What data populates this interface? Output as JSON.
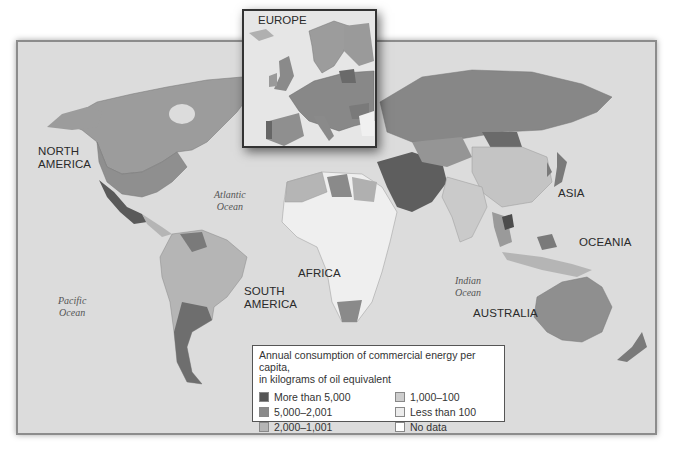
{
  "map": {
    "title": "Annual consumption of commercial energy per capita",
    "inset": {
      "title": "EUROPE"
    },
    "continent_labels": [
      {
        "id": "north-america",
        "lines": [
          "NORTH",
          "AMERICA"
        ]
      },
      {
        "id": "south-america",
        "lines": [
          "SOUTH",
          "AMERICA"
        ]
      },
      {
        "id": "africa",
        "lines": [
          "AFRICA"
        ]
      },
      {
        "id": "asia",
        "lines": [
          "ASIA"
        ]
      },
      {
        "id": "oceania",
        "lines": [
          "OCEANIA"
        ]
      },
      {
        "id": "australia",
        "lines": [
          "AUSTRALIA"
        ]
      }
    ],
    "ocean_labels": [
      {
        "id": "atlantic",
        "lines": [
          "Atlantic",
          "Ocean"
        ]
      },
      {
        "id": "pacific",
        "lines": [
          "Pacific",
          "Ocean"
        ]
      },
      {
        "id": "indian",
        "lines": [
          "Indian",
          "Ocean"
        ]
      }
    ],
    "legend": {
      "title_line1": "Annual consumption of commercial energy per capita,",
      "title_line2": "in kilograms of oil equivalent",
      "items": [
        {
          "label": "More than 5,000",
          "color": "#555555"
        },
        {
          "label": "5,000–2,001",
          "color": "#8a8a8a"
        },
        {
          "label": "2,000–1,001",
          "color": "#b5b5b5"
        },
        {
          "label": "1,000–100",
          "color": "#cdcdcd"
        },
        {
          "label": "Less than 100",
          "color": "#ececec"
        },
        {
          "label": "No data",
          "color": "#ffffff"
        }
      ]
    },
    "colors": {
      "ocean": "#dcdcdc",
      "land_high": "#555555",
      "land_midhigh": "#8a8a8a",
      "land_mid": "#b5b5b5",
      "land_low": "#cdcdcd",
      "land_verylow": "#ececec",
      "frame_border": "#8c8c8c"
    }
  }
}
